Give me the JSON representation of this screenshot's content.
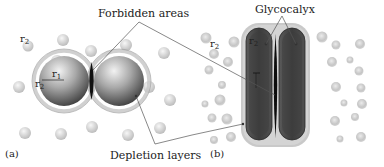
{
  "figure": {
    "labels": {
      "forbidden_areas": "Forbidden areas",
      "glycocalyx": "Glycocalyx",
      "depletion_layers": "Depletion layers",
      "panel_a": "(a)",
      "panel_b": "(b)"
    },
    "symbols": {
      "r": "r",
      "sub1": "1",
      "sub2": "2"
    },
    "colors": {
      "large_sphere_light": "#e6e6e6",
      "large_sphere_dark": "#3a3a3a",
      "depletion_halo": "#d8d8d8",
      "small_sphere": "#cfcfcf",
      "cell_body": "#4a4a4a",
      "cell_inner": "#383838",
      "glycocalyx": "#c4c4c4",
      "forbidden": "#111111",
      "leader_line": "#555555"
    },
    "panels": [
      {
        "id": "a",
        "description": "two spheres with depletion layers and forbidden area between"
      },
      {
        "id": "b",
        "description": "two rod-shaped cells with glycocalyx layer"
      }
    ]
  }
}
